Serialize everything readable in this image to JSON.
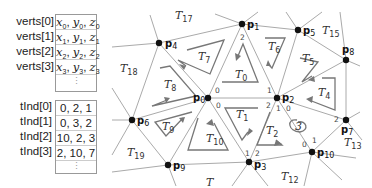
{
  "verts_table": {
    "rows": [
      {
        "label": "verts[0]",
        "value": "x0, y0, z0"
      },
      {
        "label": "verts[1]",
        "value": "x1, y1, z1"
      },
      {
        "label": "verts[2]",
        "value": "x2, y2, z2"
      },
      {
        "label": "verts[3]",
        "value": "x3, y3, z3"
      }
    ],
    "ellipsis": "⋮"
  },
  "tind_table": {
    "rows": [
      {
        "label": "tInd[0]",
        "value": "0, 2, 1"
      },
      {
        "label": "tInd[1]",
        "value": "0, 3, 2"
      },
      {
        "label": "tInd[2]",
        "value": "10, 2, 3"
      },
      {
        "label": "tInd[3]",
        "value": "2, 10, 7"
      }
    ],
    "ellipsis": "⋮"
  },
  "mesh": {
    "points": [
      {
        "name": "p0",
        "x": 208,
        "y": 98
      },
      {
        "name": "p1",
        "x": 242,
        "y": 24
      },
      {
        "name": "p2",
        "x": 277,
        "y": 98
      },
      {
        "name": "p3",
        "x": 249,
        "y": 162
      },
      {
        "name": "p4",
        "x": 159,
        "y": 43
      },
      {
        "name": "p5",
        "x": 298,
        "y": 30
      },
      {
        "name": "p6",
        "x": 132,
        "y": 120
      },
      {
        "name": "p7",
        "x": 346,
        "y": 120
      },
      {
        "name": "p8",
        "x": 346,
        "y": 60
      },
      {
        "name": "p9",
        "x": 168,
        "y": 165
      },
      {
        "name": "p10",
        "x": 312,
        "y": 152
      }
    ],
    "triangles": [
      "T0",
      "T1",
      "T2",
      "T3",
      "T4",
      "T5",
      "T6",
      "T7",
      "T8",
      "T9",
      "T10",
      "T12",
      "T13",
      "T15",
      "T17",
      "T18",
      "T19"
    ],
    "corner_indices": [
      "0",
      "1",
      "2"
    ]
  }
}
